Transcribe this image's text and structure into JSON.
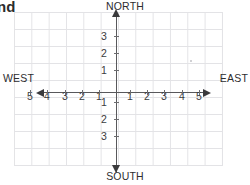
{
  "page": {
    "clipped_heading": "nd",
    "background_color": "#ffffff"
  },
  "chart_data": {
    "type": "scatter",
    "title": "",
    "subtitle": "",
    "xlabel": "",
    "ylabel": "",
    "grid": true,
    "legend": null,
    "xlim": [
      -6,
      6
    ],
    "ylim": [
      -4.5,
      4.5
    ],
    "x": [],
    "y": [],
    "values": [],
    "categories": [],
    "annotations": [],
    "axis_style": "compass-quadrant-grid-with-arrowheads",
    "direction_labels": {
      "north": "NORTH",
      "south": "SOUTH",
      "west": "WEST",
      "east": "EAST"
    },
    "x_tick_labels_west": [
      "5",
      "4",
      "3",
      "2",
      "1"
    ],
    "x_tick_labels_east": [
      "1",
      "2",
      "3",
      "4",
      "5"
    ],
    "y_tick_labels_north": [
      "3",
      "2",
      "1"
    ],
    "y_tick_labels_south": [
      "1",
      "2",
      "3"
    ],
    "colors": {
      "grid_line": "#e3e3e6",
      "axis_line": "#58585b",
      "arrowhead": "#3a3a3c",
      "tick_mark": "#6d6d70",
      "label_text": "#2d2d2f",
      "number_text": "#3b3b3d",
      "heading_text": "#2b2b2b"
    }
  },
  "axis": {
    "vertical": {
      "ticks_north": [
        {
          "label": "3",
          "x": 104,
          "y": 36
        },
        {
          "label": "2",
          "x": 104,
          "y": 53
        },
        {
          "label": "1",
          "x": 104,
          "y": 70
        }
      ],
      "ticks_south": [
        {
          "label": "1",
          "x": 104,
          "y": 102
        },
        {
          "label": "2",
          "x": 104,
          "y": 119
        },
        {
          "label": "3",
          "x": 104,
          "y": 136
        }
      ]
    },
    "horizontal": {
      "ticks_west": [
        {
          "label": "5",
          "x": 30,
          "y": 96
        },
        {
          "label": "4",
          "x": 47,
          "y": 96
        },
        {
          "label": "3",
          "x": 65,
          "y": 96
        },
        {
          "label": "2",
          "x": 82,
          "y": 96
        },
        {
          "label": "1",
          "x": 99,
          "y": 96
        }
      ],
      "ticks_east": [
        {
          "label": "1",
          "x": 130,
          "y": 96
        },
        {
          "label": "2",
          "x": 147,
          "y": 96
        },
        {
          "label": "3",
          "x": 164,
          "y": 96
        },
        {
          "label": "4",
          "x": 182,
          "y": 96
        },
        {
          "label": "5",
          "x": 199,
          "y": 96
        }
      ]
    }
  }
}
